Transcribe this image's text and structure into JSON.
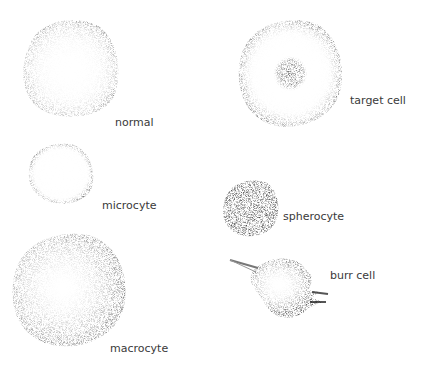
{
  "figure": {
    "top_caption_partial": "",
    "cells": [
      {
        "id": "normal",
        "label": "normal"
      },
      {
        "id": "target",
        "label": "target cell"
      },
      {
        "id": "microcyte",
        "label": "microcyte"
      },
      {
        "id": "spherocyte",
        "label": "spherocyte"
      },
      {
        "id": "macrocyte",
        "label": "macrocyte"
      },
      {
        "id": "burr",
        "label": "burr cell"
      }
    ]
  }
}
